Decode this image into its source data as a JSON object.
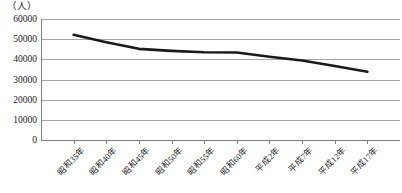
{
  "chart_data": {
    "type": "line",
    "title": "",
    "subtitle": "",
    "xlabel": "",
    "ylabel": "（人）",
    "y_unit_caption": "（人）",
    "categories": [
      "昭和35年",
      "昭和40年",
      "昭和45年",
      "昭和50年",
      "昭和55年",
      "昭和60年",
      "平成2年",
      "平成7年",
      "平成12年",
      "平成17年"
    ],
    "series": [
      {
        "name": "人口",
        "values": [
          52200,
          48500,
          45200,
          44200,
          43500,
          43400,
          41300,
          39400,
          36700,
          33800
        ],
        "color": "#1a1a1a",
        "line_width": 2.6,
        "markers": false
      }
    ],
    "ylim": [
      0,
      60000
    ],
    "y_ticks": [
      60000,
      50000,
      40000,
      30000,
      20000,
      10000,
      0
    ],
    "y_tick_labels": [
      "60000",
      "50000",
      "40000",
      "30000",
      "20000",
      "10000",
      "0"
    ],
    "grid": {
      "horizontal": true,
      "vertical": false,
      "color": "#a6a6a6"
    },
    "legend": {
      "visible": false,
      "position": "none"
    },
    "axis_color": "#808080",
    "background_color": "#ffffff",
    "x_tick_label_rotation": -45
  }
}
